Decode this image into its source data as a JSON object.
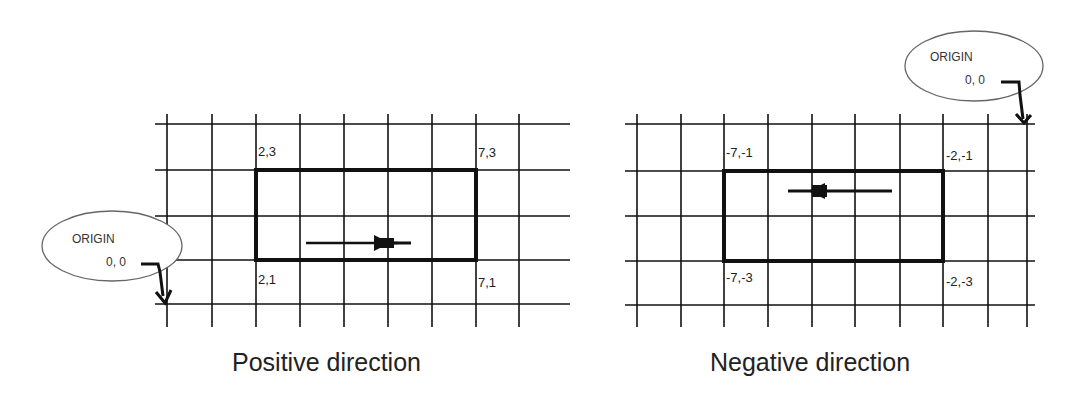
{
  "panels": [
    {
      "id": "positive",
      "caption": "Positive direction",
      "origin": {
        "title": "ORIGIN",
        "coords": "0, 0"
      },
      "corners": {
        "top_left": "2,3",
        "top_right": "7,3",
        "bottom_left": "2,1",
        "bottom_right": "7,1"
      },
      "arrow_direction": "right"
    },
    {
      "id": "negative",
      "caption": "Negative direction",
      "origin": {
        "title": "ORIGIN",
        "coords": "0, 0"
      },
      "corners": {
        "top_left": "-7,-1",
        "top_right": "-2,-1",
        "bottom_left": "-7,-3",
        "bottom_right": "-2,-3"
      },
      "arrow_direction": "left"
    }
  ],
  "colors": {
    "line": "#111111",
    "ellipse": "#555555",
    "text": "#222222",
    "background": "#ffffff"
  }
}
